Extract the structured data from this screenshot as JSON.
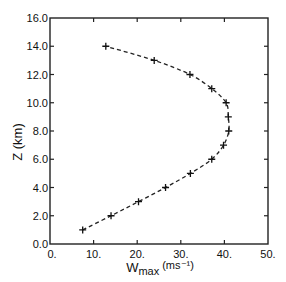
{
  "chart_data": {
    "type": "line",
    "title": "",
    "xlabel": "W",
    "xlabel_sub": "max",
    "xlabel_units": "(ms⁻¹)",
    "ylabel": "Z (km)",
    "xlim": [
      0,
      50
    ],
    "ylim": [
      0,
      16
    ],
    "xticks": [
      0,
      10,
      20,
      30,
      40,
      50
    ],
    "xtick_labels": [
      "0.",
      "10.",
      "20.",
      "30.",
      "40.",
      "50."
    ],
    "yticks": [
      0,
      2,
      4,
      6,
      8,
      10,
      12,
      14,
      16
    ],
    "ytick_labels": [
      "0.0",
      "2.0",
      "4.0",
      "6.0",
      "8.0",
      "10.0",
      "12.0",
      "14.0",
      "16.0"
    ],
    "grid": false,
    "line_style": "dashed",
    "marker": "+",
    "series": [
      {
        "name": "Wmax profile",
        "points": [
          {
            "z": 1,
            "w": 7.5
          },
          {
            "z": 2,
            "w": 14.0
          },
          {
            "z": 3,
            "w": 20.3
          },
          {
            "z": 4,
            "w": 26.5
          },
          {
            "z": 5,
            "w": 32.2
          },
          {
            "z": 6,
            "w": 37.1
          },
          {
            "z": 7,
            "w": 39.8
          },
          {
            "z": 8,
            "w": 41.0
          },
          {
            "z": 9,
            "w": 40.9
          },
          {
            "z": 10,
            "w": 40.4
          },
          {
            "z": 11,
            "w": 37.1
          },
          {
            "z": 12,
            "w": 32.1
          },
          {
            "z": 13,
            "w": 23.9
          },
          {
            "z": 14,
            "w": 12.8
          }
        ]
      }
    ]
  }
}
